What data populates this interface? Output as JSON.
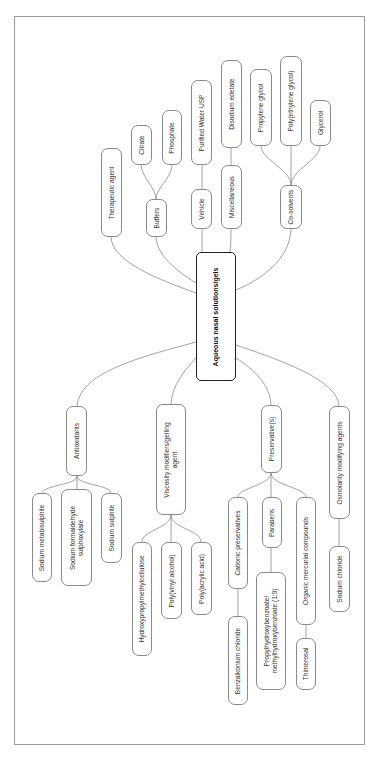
{
  "diagram": {
    "title": "Aqueous nasal solutions/gels",
    "orientation": "rotated-90-ccw",
    "frame": {
      "border_color": "#9a9a9a"
    },
    "colors": {
      "node_border": "#8a8a8a",
      "center_border": "#222222",
      "link": "#8a8a8a",
      "text": "#333333"
    },
    "nodes": [
      {
        "id": "center",
        "label": "Aqueous nasal solutions/gels",
        "box": [
          196,
          252,
          236,
          381
        ],
        "center": true
      },
      {
        "id": "therapeutic",
        "label": "Therapeutic agent",
        "box": [
          101,
          148,
          122,
          237
        ]
      },
      {
        "id": "buffers",
        "label": "Buffers",
        "box": [
          146,
          199,
          167,
          237
        ]
      },
      {
        "id": "citrate",
        "label": "Citrate",
        "box": [
          131,
          125,
          152,
          165
        ]
      },
      {
        "id": "phosphate",
        "label": "Phosphate",
        "box": [
          162,
          110,
          182,
          165
        ]
      },
      {
        "id": "vehicle",
        "label": "Vehicle",
        "box": [
          191,
          189,
          212,
          229
        ]
      },
      {
        "id": "water",
        "label": "Purified Water USP",
        "box": [
          191,
          80,
          212,
          165
        ]
      },
      {
        "id": "misc",
        "label": "Miscellaneous",
        "box": [
          221,
          165,
          242,
          229
        ]
      },
      {
        "id": "edetate",
        "label": "Disodium edetate",
        "box": [
          221,
          60,
          242,
          148
        ]
      },
      {
        "id": "cosolvents",
        "label": "Co-solvents",
        "box": [
          280,
          185,
          302,
          229
        ]
      },
      {
        "id": "pg",
        "label": "Propylene glycol",
        "box": [
          250,
          69,
          272,
          146
        ]
      },
      {
        "id": "peg",
        "label": "Poly(ethylene glycol)",
        "box": [
          280,
          56,
          302,
          146
        ]
      },
      {
        "id": "glycerol",
        "label": "Glycerol",
        "box": [
          310,
          100,
          331,
          146
        ]
      },
      {
        "id": "antioxidants",
        "label": "Antioxidants",
        "box": [
          66,
          406,
          87,
          476
        ]
      },
      {
        "id": "metabisulphite",
        "label": "Sodium metabisulphite",
        "box": [
          32,
          493,
          52,
          582
        ]
      },
      {
        "id": "formaldehyde",
        "label": "Sodium formaldehyde\nsulphoxylate",
        "box": [
          61,
          489,
          92,
          586
        ]
      },
      {
        "id": "sulphite",
        "label": "Sodium sulphite",
        "box": [
          101,
          493,
          122,
          563
        ]
      },
      {
        "id": "viscosity",
        "label": "Viscosity modifiers/gelling\nagent",
        "box": [
          156,
          404,
          186,
          515
        ]
      },
      {
        "id": "hpmc",
        "label": "Hydroxypropylmethylcellulose",
        "box": [
          132,
          542,
          152,
          656
        ]
      },
      {
        "id": "pva",
        "label": "Poly(vinyl alcohol)",
        "box": [
          161,
          542,
          182,
          619
        ]
      },
      {
        "id": "paa",
        "label": "Poly(acrylic acid)",
        "box": [
          191,
          542,
          212,
          615
        ]
      },
      {
        "id": "preservatives",
        "label": "Preservative(s)",
        "box": [
          261,
          405,
          282,
          473
        ]
      },
      {
        "id": "cationic",
        "label": "Cationic preservatives",
        "box": [
          228,
          497,
          248,
          589
        ]
      },
      {
        "id": "parabens",
        "label": "Parabens",
        "box": [
          262,
          497,
          282,
          548
        ]
      },
      {
        "id": "mercurial",
        "label": "Organic mercurial compounds",
        "box": [
          296,
          497,
          316,
          625
        ]
      },
      {
        "id": "benzalkonium",
        "label": "Benzalkonium chloride",
        "box": [
          228,
          616,
          248,
          705
        ]
      },
      {
        "id": "hydroxybenzoate",
        "label": "Propylhydroxybenzoate/\nmethylhydroxybenzoate (1:9)",
        "box": [
          256,
          572,
          286,
          690
        ]
      },
      {
        "id": "thimerosal",
        "label": "Thimerosal",
        "box": [
          296,
          638,
          316,
          690
        ]
      },
      {
        "id": "osmolarity",
        "label": "Osmolarity modifying agents",
        "box": [
          329,
          406,
          350,
          519
        ]
      },
      {
        "id": "nacl",
        "label": "Sodium chloride",
        "box": [
          329,
          546,
          350,
          612
        ]
      }
    ],
    "links": [
      "M196,293 C160,280 112,262 111,237",
      "M196,283 C175,270 157,255 156,237",
      "M202,252 C202,245 202,235 202,229",
      "M230,252 C231,245 231,235 231,229",
      "M236,290 C260,280 290,260 291,229",
      "M156,199 C156,188 142,178 141,165",
      "M156,199 C156,188 172,178 172,165",
      "M202,189 L202,165",
      "M231,165 L231,148",
      "M291,185 C291,170 262,160 261,146",
      "M291,185 L291,146",
      "M291,185 C291,170 320,160 320,146",
      "M196,342 C150,355 80,370 77,406",
      "M196,358 C185,370 172,385 171,404",
      "M236,358 C255,370 270,385 271,405",
      "M236,345 C280,360 338,380 339,406",
      "M77,476 C77,485 44,485 42,493",
      "M77,476 L77,489",
      "M77,476 C77,485 111,485 111,493",
      "M171,515 C171,528 142,530 142,542",
      "M171,515 L171,542",
      "M171,515 C171,528 201,530 201,542",
      "M271,473 C271,485 238,488 238,497",
      "M271,473 L271,497",
      "M271,473 C271,485 306,488 306,497",
      "M238,589 L238,616",
      "M271,548 L271,572",
      "M306,625 L306,638",
      "M339,519 L339,546"
    ]
  }
}
